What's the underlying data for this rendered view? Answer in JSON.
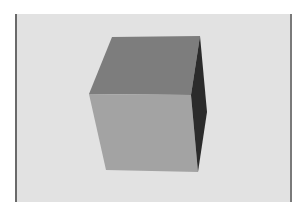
{
  "scene": {
    "subject": "cube-3d-rendering",
    "background_color": "#e2e2e2",
    "frame_edge_color": "#6a6a6a",
    "faces": {
      "top": {
        "color": "#7d7d7d",
        "points": "112,37 200,36 191,95 89,94"
      },
      "front": {
        "color": "#a3a3a3",
        "points": "89,94 191,95 198,172 106,170"
      },
      "right": {
        "color": "#2b2b2b",
        "points": "200,36 207,112 198,172 191,95"
      }
    }
  }
}
